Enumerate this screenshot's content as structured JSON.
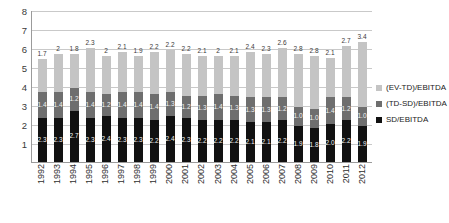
{
  "chart_data": {
    "type": "bar",
    "title": "",
    "xlabel": "",
    "ylabel": "",
    "ylim": [
      0,
      8
    ],
    "yticks": [
      0,
      1,
      2,
      3,
      4,
      5,
      6,
      7,
      8
    ],
    "ytick_labels": [
      "",
      "1",
      "2",
      "3",
      "4",
      "5",
      "6",
      "7",
      "8"
    ],
    "grid": true,
    "stacked": true,
    "legend_position": "right",
    "categories": [
      "1992",
      "1993",
      "1994",
      "1995",
      "1996",
      "1997",
      "1998",
      "1999",
      "2000",
      "2001",
      "2002",
      "2003",
      "2004",
      "2005",
      "2006",
      "2007",
      "2008",
      "2009",
      "2010",
      "2011",
      "2012"
    ],
    "series": [
      {
        "name": "SD/EBITDA",
        "color": "#111111",
        "values": [
          2.3,
          2.3,
          2.7,
          2.3,
          2.4,
          2.3,
          2.3,
          2.2,
          2.4,
          2.3,
          2.2,
          2.2,
          2.2,
          2.1,
          2.1,
          2.2,
          1.9,
          1.8,
          2.0,
          2.2,
          1.9
        ],
        "labels": [
          "2.3",
          "2.3",
          "2.7",
          "2.3",
          "2.4",
          "2.3",
          "2.3",
          "2.2",
          "2.4",
          "2.3",
          "2.2",
          "2.2",
          "2.2",
          "2.1",
          "2.1",
          "2.2",
          "1.9",
          "1.8",
          "2.0",
          "2.2",
          "1.9"
        ]
      },
      {
        "name": "(TD-SD)/EBITDA",
        "color": "#6e6e6e",
        "values": [
          1.4,
          1.4,
          1.2,
          1.4,
          1.2,
          1.4,
          1.4,
          1.4,
          1.3,
          1.2,
          1.3,
          1.4,
          1.3,
          1.3,
          1.3,
          1.2,
          1.0,
          1.0,
          1.4,
          1.2,
          1.0
        ],
        "labels": [
          "1.4",
          "1.4",
          "1.2",
          "1.4",
          "1.2",
          "1.4",
          "1.4",
          "1.4",
          "1.3",
          "1.2",
          "1.3",
          "1.4",
          "1.3",
          "1.3",
          "1.3",
          "1.2",
          "1.0",
          "1.0",
          "1.4",
          "1.2",
          "1.0"
        ]
      },
      {
        "name": "(EV-TD)/EBITDA",
        "color": "#c4c4c4",
        "values": [
          1.7,
          2.0,
          1.8,
          2.3,
          2.0,
          2.1,
          1.9,
          2.2,
          2.2,
          2.2,
          2.1,
          2.0,
          2.1,
          2.4,
          2.3,
          2.6,
          2.8,
          2.8,
          2.1,
          2.7,
          3.4
        ],
        "labels": [
          "1.7",
          "2",
          "1.8",
          "2.3",
          "2",
          "2.1",
          "1.9",
          "2.2",
          "2.2",
          "2.2",
          "2.1",
          "2",
          "2.1",
          "2.4",
          "2.3",
          "2.6",
          "2.8",
          "2.8",
          "2.1",
          "2.7",
          "3.4"
        ]
      }
    ],
    "totals": [
      5.4,
      5.7,
      5.7,
      6.0,
      5.6,
      5.8,
      5.6,
      5.8,
      5.9,
      5.7,
      5.6,
      5.6,
      5.6,
      5.8,
      5.7,
      6.0,
      5.7,
      5.6,
      5.5,
      6.1,
      6.3
    ]
  },
  "legend": {
    "items": [
      {
        "label": "(EV-TD)/EBITDA",
        "color": "#c4c4c4"
      },
      {
        "label": "(TD-SD)/EBITDA",
        "color": "#6e6e6e"
      },
      {
        "label": "SD/EBITDA",
        "color": "#111111"
      }
    ]
  }
}
